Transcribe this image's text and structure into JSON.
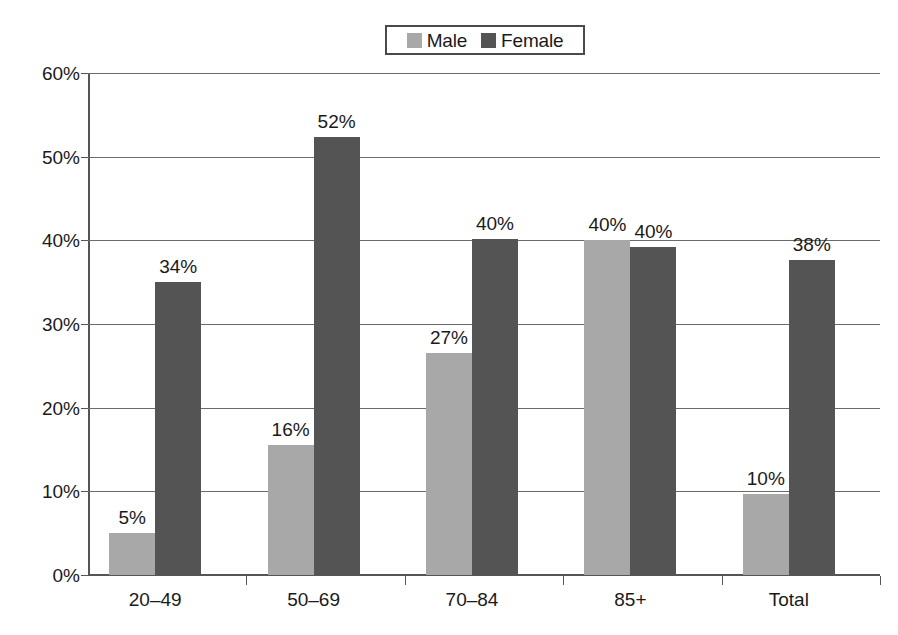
{
  "chart_data": {
    "type": "bar",
    "title": "",
    "subtitle": "",
    "xlabel": "",
    "ylabel": "",
    "ylim": [
      0,
      60
    ],
    "ytick_labels": [
      "0%",
      "10%",
      "20%",
      "30%",
      "40%",
      "50%",
      "60%"
    ],
    "ytick_values": [
      0,
      10,
      20,
      30,
      40,
      50,
      60
    ],
    "grid": true,
    "legend_position": "top-center",
    "categories": [
      "20–49",
      "50–69",
      "70–84",
      "85+",
      "Total"
    ],
    "series": [
      {
        "name": "Male",
        "color": "#a8a8a8",
        "values": [
          5,
          16,
          27,
          40,
          10
        ],
        "plotted_values": [
          5.0,
          15.5,
          26.5,
          40.0,
          9.7
        ],
        "labels": [
          "5%",
          "16%",
          "27%",
          "40%",
          "10%"
        ]
      },
      {
        "name": "Female",
        "color": "#545454",
        "values": [
          34,
          52,
          40,
          40,
          38
        ],
        "plotted_values": [
          35.0,
          52.3,
          40.2,
          39.2,
          37.7
        ],
        "labels": [
          "34%",
          "52%",
          "40%",
          "40%",
          "38%"
        ]
      }
    ]
  },
  "legend": {
    "entries": [
      {
        "label": "Male",
        "color": "#a8a8a8",
        "swatch_name": "legend-swatch-male"
      },
      {
        "label": "Female",
        "color": "#545454",
        "swatch_name": "legend-swatch-female"
      }
    ]
  },
  "axis": {
    "y_labels": [
      "60%",
      "50%",
      "40%",
      "30%",
      "20%",
      "10%",
      "0%"
    ],
    "x_labels": [
      "20–49",
      "50–69",
      "70–84",
      "85+",
      "Total"
    ]
  },
  "colors": {
    "male_bar": "#a8a8a8",
    "female_bar": "#545454",
    "gridline": "#6b6b6b",
    "axis": "#555555",
    "text": "#1a1a1a",
    "background": "#ffffff",
    "legend_border": "#4a4a4a"
  }
}
